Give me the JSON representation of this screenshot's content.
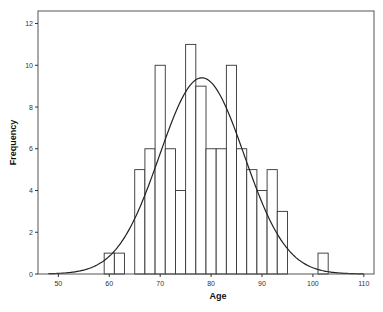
{
  "chart_data": {
    "type": "bar",
    "subtype": "histogram_with_normal_curve",
    "title": "",
    "xlabel": "Age",
    "ylabel": "Frequency",
    "xlim": [
      46,
      112
    ],
    "ylim": [
      0,
      12.6
    ],
    "x_ticks": [
      50,
      60,
      70,
      80,
      90,
      100,
      110
    ],
    "y_ticks": [
      0,
      2,
      4,
      6,
      8,
      10,
      12
    ],
    "grid": false,
    "bin_width": 2,
    "bins": [
      {
        "start": 59,
        "end": 61,
        "count": 1
      },
      {
        "start": 61,
        "end": 63,
        "count": 1
      },
      {
        "start": 65,
        "end": 67,
        "count": 5
      },
      {
        "start": 67,
        "end": 69,
        "count": 6
      },
      {
        "start": 69,
        "end": 71,
        "count": 10
      },
      {
        "start": 71,
        "end": 73,
        "count": 6
      },
      {
        "start": 73,
        "end": 75,
        "count": 4
      },
      {
        "start": 75,
        "end": 77,
        "count": 11
      },
      {
        "start": 77,
        "end": 79,
        "count": 9
      },
      {
        "start": 79,
        "end": 81,
        "count": 6
      },
      {
        "start": 81,
        "end": 83,
        "count": 6
      },
      {
        "start": 83,
        "end": 85,
        "count": 10
      },
      {
        "start": 85,
        "end": 87,
        "count": 6
      },
      {
        "start": 87,
        "end": 89,
        "count": 5
      },
      {
        "start": 89,
        "end": 91,
        "count": 4
      },
      {
        "start": 91,
        "end": 93,
        "count": 5
      },
      {
        "start": 93,
        "end": 95,
        "count": 3
      },
      {
        "start": 101,
        "end": 103,
        "count": 1
      }
    ],
    "normal_curve": {
      "mean": 78.2,
      "peak": 9.4,
      "sd": 8.3
    }
  }
}
